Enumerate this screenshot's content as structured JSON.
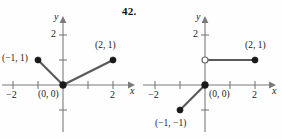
{
  "figure": {
    "problem_number": "42.",
    "background_color": "#fefefe",
    "curve_color": "#5a5a5a",
    "axis_color": "#7a7a7a",
    "point_color": "#1a1a1a"
  },
  "plots": [
    {
      "id": "left",
      "axis_labels": {
        "x": "x",
        "y": "y"
      },
      "x_ticks": [
        {
          "value": -2,
          "label": "−2"
        },
        {
          "value": -1,
          "label": ""
        },
        {
          "value": 1,
          "label": ""
        },
        {
          "value": 2,
          "label": "2"
        }
      ],
      "y_ticks": [
        {
          "value": 2,
          "label": "2"
        },
        {
          "value": 1,
          "label": ""
        },
        {
          "value": -1,
          "label": ""
        }
      ],
      "x_range": [
        -2.6,
        2.9
      ],
      "y_range": [
        -1.8,
        2.6
      ],
      "segments": [
        {
          "from": [
            -1,
            1
          ],
          "to": [
            0,
            0
          ]
        },
        {
          "from": [
            0,
            0
          ],
          "to": [
            2,
            1
          ]
        }
      ],
      "points": [
        {
          "at": [
            -1,
            1
          ],
          "kind": "closed",
          "label": "(−1, 1)"
        },
        {
          "at": [
            0,
            0
          ],
          "kind": "closed",
          "label": "(0, 0)"
        },
        {
          "at": [
            2,
            1
          ],
          "kind": "closed",
          "label": "(2, 1)"
        }
      ]
    },
    {
      "id": "right",
      "axis_labels": {
        "x": "x",
        "y": "y"
      },
      "x_ticks": [
        {
          "value": -2,
          "label": "−2"
        },
        {
          "value": -1,
          "label": ""
        },
        {
          "value": 1,
          "label": ""
        },
        {
          "value": 2,
          "label": "2"
        }
      ],
      "y_ticks": [
        {
          "value": 2,
          "label": "2"
        },
        {
          "value": 1,
          "label": ""
        },
        {
          "value": -1,
          "label": ""
        }
      ],
      "x_range": [
        -2.6,
        2.9
      ],
      "y_range": [
        -1.8,
        2.6
      ],
      "segments": [
        {
          "from": [
            0,
            1
          ],
          "to": [
            2,
            1
          ]
        },
        {
          "from": [
            0,
            0
          ],
          "to": [
            -1,
            -1
          ]
        }
      ],
      "points": [
        {
          "at": [
            0,
            1
          ],
          "kind": "open",
          "label": ""
        },
        {
          "at": [
            2,
            1
          ],
          "kind": "closed",
          "label": "(2, 1)"
        },
        {
          "at": [
            0,
            0
          ],
          "kind": "closed",
          "label": "(0, 0)"
        },
        {
          "at": [
            -1,
            -1
          ],
          "kind": "closed",
          "label": "(−1, −1)"
        }
      ]
    }
  ],
  "labels": {
    "left": {
      "y_axis": "y",
      "x_axis": "x",
      "y_tick_2": "2",
      "x_tick_neg2": "−2",
      "x_tick_2": "2",
      "pt_neg1_1": "(−1, 1)",
      "pt_2_1": "(2, 1)",
      "pt_origin": "(0, 0)"
    },
    "right": {
      "y_axis": "y",
      "x_axis": "x",
      "y_tick_2": "2",
      "x_tick_neg2": "−2",
      "x_tick_2": "2",
      "pt_2_1": "(2, 1)",
      "pt_origin": "(0, 0)",
      "pt_neg1_neg1": "(−1, −1)"
    }
  }
}
